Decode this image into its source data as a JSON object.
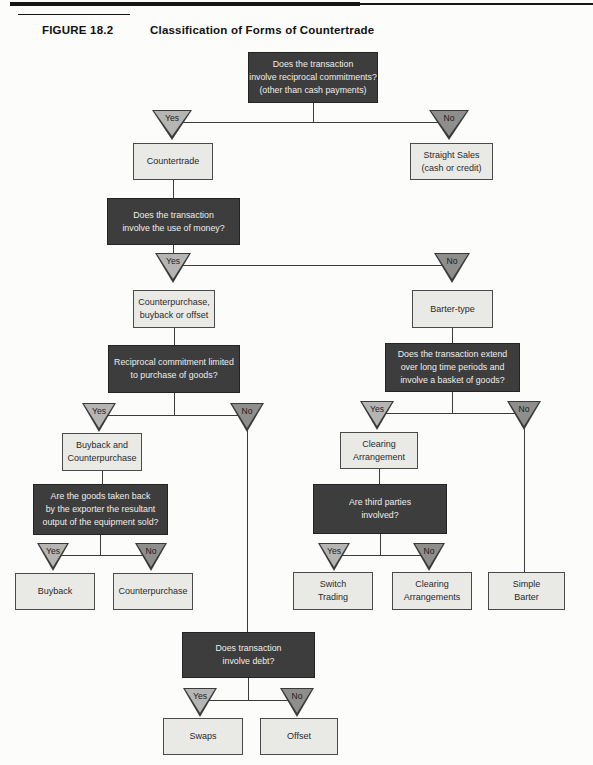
{
  "header": {
    "figure_label": "FIGURE 18.2",
    "title": "Classification of Forms of Countertrade"
  },
  "labels": {
    "yes": "Yes",
    "no": "No"
  },
  "colors": {
    "question_box": "#3d3d3d",
    "question_text": "#ededeb",
    "result_box": "#e9e9e6",
    "result_border": "#4a4a4a",
    "yes_triangle": "#b5b5b3",
    "no_triangle": "#8e8e8c",
    "line": "#3c3c3c"
  },
  "nodes": {
    "q_reciprocal": "Does the transaction\ninvolve reciprocal commitments?\n(other than cash payments)",
    "q_money": "Does the transaction\ninvolve the use of money?",
    "q_limited_goods": "Reciprocal commitment limited\nto purchase of goods?",
    "q_goods_taken_back": "Are the goods taken back\nby the exporter the resultant\noutput of the equipment sold?",
    "q_long_periods": "Does the transaction extend\nover long time periods and\ninvolve a basket of goods?",
    "q_third_parties": "Are third parties\ninvolved?",
    "q_debt": "Does transaction\ninvolve debt?",
    "countertrade": "Countertrade",
    "straight_sales": "Straight Sales\n(cash or credit)",
    "counterpurchase_buyback_offset": "Counterpurchase,\nbuyback or offset",
    "barter_type": "Barter-type",
    "buyback_and_counterpurchase": "Buyback and\nCounterpurchase",
    "buyback": "Buyback",
    "counterpurchase": "Counterpurchase",
    "clearing_arrangement": "Clearing\nArrangement",
    "switch_trading": "Switch\nTrading",
    "clearing_arrangements": "Clearing\nArrangements",
    "simple_barter": "Simple\nBarter",
    "swaps": "Swaps",
    "offset": "Offset"
  }
}
